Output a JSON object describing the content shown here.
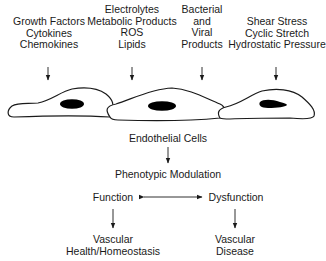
{
  "inputs": [
    {
      "id": "growth",
      "lines": [
        "Growth Factors",
        "Cytokines",
        "Chemokines"
      ],
      "cx": 49,
      "top": 16
    },
    {
      "id": "metabolic",
      "lines": [
        "Electrolytes",
        "Metabolic Products",
        "ROS",
        "Lipids"
      ],
      "cx": 132,
      "top": 4
    },
    {
      "id": "microbial",
      "lines": [
        "Bacterial",
        "and",
        "Viral",
        "Products"
      ],
      "cx": 202,
      "top": 4
    },
    {
      "id": "mechanical",
      "lines": [
        "Shear Stress",
        "Cyclic Stretch",
        "Hydrostatic Pressure"
      ],
      "cx": 277,
      "top": 16
    }
  ],
  "cells_label": "Endothelial Cells",
  "modulation_label": "Phenotypic Modulation",
  "function_label": "Function",
  "dysfunction_label": "Dysfunction",
  "outcome_health": [
    "Vascular",
    "Health/Homeostasis"
  ],
  "outcome_disease": [
    "Vascular",
    "Disease"
  ],
  "colors": {
    "ink": "#1a1a1a",
    "background": "#ffffff"
  }
}
